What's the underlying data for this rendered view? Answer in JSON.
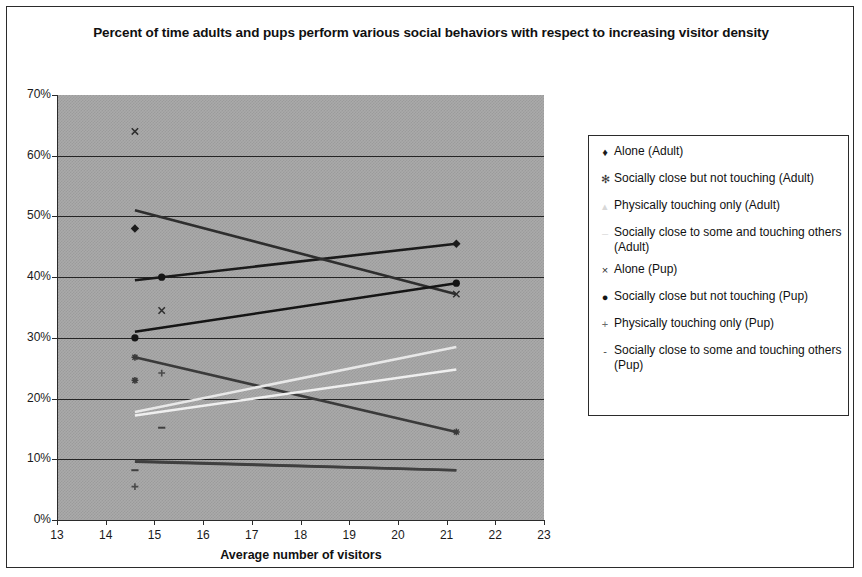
{
  "chart_data": {
    "type": "scatter",
    "title": "Percent of time adults and pups perform various social behaviors with respect to increasing visitor density",
    "xlabel": "Average number of visitors",
    "ylabel": "",
    "xlim": [
      13,
      23
    ],
    "ylim": [
      0,
      0.7
    ],
    "grid": true,
    "legend_position": "right",
    "xticks": [
      "13",
      "14",
      "15",
      "16",
      "17",
      "18",
      "19",
      "20",
      "21",
      "22",
      "23"
    ],
    "yticks": [
      "0%",
      "10%",
      "20%",
      "30%",
      "40%",
      "50%",
      "60%",
      "70%"
    ],
    "x": [
      14.6,
      21.2
    ],
    "series": [
      {
        "name": "Alone (Adult)",
        "marker": "diamond",
        "color": "#1b1b1b",
        "x": [
          14.6,
          21.2
        ],
        "values": [
          0.48,
          0.455
        ],
        "trendline": [
          0.395,
          0.455
        ]
      },
      {
        "name": "Socially close but not touching (Adult)",
        "marker": "asterisk",
        "color": "#3a3a3a",
        "x": [
          14.6,
          21.2
        ],
        "values": [
          0.23,
          0.145
        ],
        "trendline": [
          0.268,
          0.145
        ]
      },
      {
        "name": "Physically touching only (Adult)",
        "marker": "triangle-light",
        "color": "#e8e8e8",
        "x": [
          14.6,
          21.2
        ],
        "values": [
          0.178,
          0.285
        ],
        "trendline": [
          0.178,
          0.285
        ]
      },
      {
        "name": "Socially close to some and touching others (Adult)",
        "marker": "dash-light",
        "color": "#efefef",
        "x": [
          14.6,
          21.2
        ],
        "values": [
          0.172,
          0.248
        ],
        "trendline": [
          0.172,
          0.248
        ]
      },
      {
        "name": "Alone (Pup)",
        "marker": "x",
        "color": "#2e2e2e",
        "x": [
          14.6,
          15.15,
          21.2
        ],
        "values": [
          0.64,
          0.345,
          0.372
        ],
        "trendline": [
          0.51,
          0.372
        ]
      },
      {
        "name": "Socially close but not touching (Pup)",
        "marker": "circle",
        "color": "#151515",
        "x": [
          14.6,
          15.15,
          21.2
        ],
        "values": [
          0.3,
          0.4,
          0.39
        ],
        "trendline": [
          0.31,
          0.39
        ]
      },
      {
        "name": "Physically touching only (Pup)",
        "marker": "plus",
        "color": "#4a4a4a",
        "x": [
          14.6,
          15.15
        ],
        "values": [
          0.055,
          0.242
        ],
        "trendline": [
          0.097,
          0.082
        ]
      },
      {
        "name": "Socially close to some and touching others (Pup)",
        "marker": "dash",
        "color": "#3f3f3f",
        "x": [
          14.6,
          15.15
        ],
        "values": [
          0.082,
          0.152
        ],
        "trendline": [
          0.096,
          0.082
        ]
      }
    ],
    "markers_plotted": [
      {
        "x": 14.6,
        "y": 0.64,
        "series": "Alone (Pup)",
        "glyph": "x"
      },
      {
        "x": 14.6,
        "y": 0.48,
        "series": "Alone (Adult)",
        "glyph": "diamond"
      },
      {
        "x": 15.15,
        "y": 0.4,
        "series": "Socially close but not touching (Pup)",
        "glyph": "circle"
      },
      {
        "x": 15.15,
        "y": 0.345,
        "series": "Alone (Pup)",
        "glyph": "x"
      },
      {
        "x": 14.6,
        "y": 0.3,
        "series": "Socially close but not touching (Pup)",
        "glyph": "circle"
      },
      {
        "x": 14.6,
        "y": 0.268,
        "series": "Socially close but not touching (Adult)",
        "glyph": "asterisk"
      },
      {
        "x": 15.15,
        "y": 0.242,
        "series": "Physically touching only (Pup)",
        "glyph": "plus"
      },
      {
        "x": 14.6,
        "y": 0.23,
        "series": "Socially close but not touching (Adult)",
        "glyph": "asterisk"
      },
      {
        "x": 15.15,
        "y": 0.152,
        "series": "Socially close to some and touching others (Pup)",
        "glyph": "dash"
      },
      {
        "x": 21.2,
        "y": 0.455,
        "series": "Alone (Adult)",
        "glyph": "diamond"
      },
      {
        "x": 21.2,
        "y": 0.39,
        "series": "Socially close but not touching (Pup)",
        "glyph": "circle"
      },
      {
        "x": 21.2,
        "y": 0.372,
        "series": "Alone (Pup)",
        "glyph": "x"
      },
      {
        "x": 21.2,
        "y": 0.145,
        "series": "Socially close but not touching (Adult)",
        "glyph": "asterisk"
      },
      {
        "x": 14.6,
        "y": 0.082,
        "series": "Socially close to some and touching others (Pup)",
        "glyph": "dash"
      },
      {
        "x": 14.6,
        "y": 0.055,
        "series": "Physically touching only (Pup)",
        "glyph": "plus"
      }
    ]
  },
  "legend": {
    "items": [
      {
        "marker": "♦",
        "label": "Alone (Adult)",
        "color": "#1b1b1b"
      },
      {
        "marker": "✻",
        "label": "Socially close but not touching (Adult)",
        "color": "#3a3a3a"
      },
      {
        "marker": "▴",
        "label": "Physically touching only (Adult)",
        "color": "#d8d8d8"
      },
      {
        "marker": "–",
        "label": "Socially close to some and touching others (Adult)",
        "color": "#dcdcdc"
      },
      {
        "marker": "×",
        "label": "Alone (Pup)",
        "color": "#2e2e2e"
      },
      {
        "marker": "●",
        "label": "Socially close but not touching (Pup)",
        "color": "#151515"
      },
      {
        "marker": "+",
        "label": "Physically touching only (Pup)",
        "color": "#6a6a6a"
      },
      {
        "marker": "-",
        "label": "Socially close to some and touching others (Pup)",
        "color": "#4a4a4a"
      }
    ]
  },
  "style": {
    "plot_background": "#aaaaaa",
    "gridline_color": "#242424",
    "frame_border": "#2b2b2b"
  }
}
